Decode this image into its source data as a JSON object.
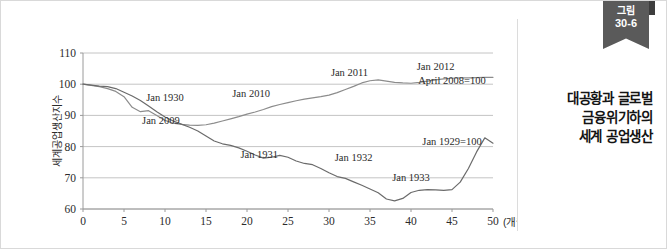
{
  "figure": {
    "ribbon_label": "그림",
    "ribbon_number": "30-6",
    "caption_line1": "대공황과 글로벌",
    "caption_line2": "금융위기하의",
    "caption_line3": "세계 공업생산"
  },
  "chart_data": {
    "type": "line",
    "title": "대공황과 글로벌 금융위기하의 세계 공업생산",
    "xlabel": "(개월 수)",
    "ylabel": "세계공업생산지수",
    "xlim": [
      0,
      50
    ],
    "ylim": [
      60,
      110
    ],
    "xticks": [
      0,
      5,
      10,
      15,
      20,
      25,
      30,
      35,
      40,
      45,
      50
    ],
    "yticks": [
      60,
      70,
      80,
      90,
      100,
      110
    ],
    "grid": "horizontal",
    "legend": "none",
    "annotations": [
      {
        "text": "Jan 1930",
        "x": 10.0,
        "y": 94.6
      },
      {
        "text": "Jan 2009",
        "x": 9.5,
        "y": 87.3
      },
      {
        "text": "Jan 2010",
        "x": 20.5,
        "y": 95.9
      },
      {
        "text": "Jan 1931",
        "x": 21.5,
        "y": 76.4
      },
      {
        "text": "Jan 2011",
        "x": 32.5,
        "y": 102.6
      },
      {
        "text": "Jan 1932",
        "x": 33.0,
        "y": 75.4
      },
      {
        "text": "Jan 1933",
        "x": 40.0,
        "y": 68.9
      },
      {
        "text": "Jan 2012",
        "x": 43.0,
        "y": 104.5
      },
      {
        "text": "April 2008=100",
        "x": 45.0,
        "y": 100.2
      },
      {
        "text": "Jan 1929=100",
        "x": 45.0,
        "y": 80.6
      }
    ],
    "series": [
      {
        "name": "April 2008=100",
        "color": "#8c8c8c",
        "x": [
          0,
          1,
          2,
          3,
          4,
          5,
          6,
          7,
          8,
          9,
          10,
          11,
          12,
          13,
          14,
          15,
          16,
          17,
          18,
          19,
          20,
          21,
          22,
          23,
          24,
          25,
          26,
          27,
          28,
          29,
          30,
          31,
          32,
          33,
          34,
          35,
          36,
          37,
          38,
          39,
          40,
          41,
          42,
          43,
          44,
          45,
          46,
          47,
          48,
          49,
          50
        ],
        "y": [
          100.0,
          99.6,
          99.2,
          98.6,
          97.7,
          96.0,
          92.6,
          91.2,
          91.5,
          90.0,
          88.4,
          87.5,
          87.1,
          86.9,
          86.8,
          87.0,
          87.5,
          88.2,
          88.9,
          89.6,
          90.4,
          91.1,
          91.9,
          92.8,
          93.5,
          94.1,
          94.7,
          95.2,
          95.6,
          96.0,
          96.5,
          97.3,
          98.3,
          99.3,
          100.4,
          101.1,
          101.4,
          101.0,
          100.6,
          100.4,
          100.3,
          100.6,
          101.0,
          101.4,
          101.7,
          101.9,
          102.0,
          102.0,
          102.1,
          102.2,
          102.2
        ]
      },
      {
        "name": "Jan 1929=100",
        "color": "#6b6b6b",
        "x": [
          0,
          1,
          2,
          3,
          4,
          5,
          6,
          7,
          8,
          9,
          10,
          11,
          12,
          13,
          14,
          15,
          16,
          17,
          18,
          19,
          20,
          21,
          22,
          23,
          24,
          25,
          26,
          27,
          28,
          29,
          30,
          31,
          32,
          33,
          34,
          35,
          36,
          37,
          38,
          39,
          40,
          41,
          42,
          43,
          44,
          45,
          46,
          47,
          48,
          49,
          50
        ],
        "y": [
          100.0,
          99.7,
          99.4,
          99.2,
          98.6,
          97.4,
          96.2,
          94.8,
          93.0,
          91.2,
          89.5,
          88.2,
          87.2,
          86.2,
          85.0,
          83.4,
          81.8,
          80.9,
          80.4,
          79.6,
          78.5,
          77.3,
          76.3,
          76.6,
          77.2,
          76.6,
          75.4,
          74.6,
          74.2,
          73.0,
          71.6,
          70.4,
          69.8,
          68.7,
          67.6,
          66.4,
          65.2,
          63.2,
          62.6,
          63.4,
          65.3,
          66.0,
          66.2,
          66.1,
          66.0,
          66.2,
          68.6,
          73.0,
          78.3,
          82.8,
          81.1
        ]
      }
    ]
  }
}
